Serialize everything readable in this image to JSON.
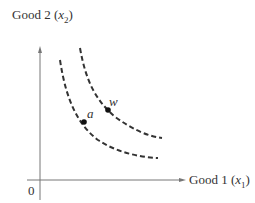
{
  "diagram": {
    "y_axis": {
      "label": "Good 2",
      "var": "x",
      "sub": "2"
    },
    "x_axis": {
      "label": "Good 1",
      "var": "x",
      "sub": "1"
    },
    "origin": "0",
    "curves": [
      {
        "name": "inner-indifference-curve",
        "style": "dashed",
        "point": "a"
      },
      {
        "name": "outer-indifference-curve",
        "style": "dashed",
        "point": "w"
      }
    ],
    "points": [
      {
        "label": "a",
        "curve": "inner"
      },
      {
        "label": "w",
        "curve": "outer"
      }
    ],
    "colors": {
      "ink": "#333333",
      "axis": "#777777"
    }
  }
}
